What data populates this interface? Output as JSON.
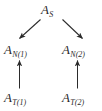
{
  "diagram": {
    "type": "commutative-diagram",
    "background_color": "#ffffff",
    "ink_color": "#2b2b2b",
    "nodes": [
      {
        "id": "A_S",
        "base": "A",
        "subscript": "S",
        "row": "top",
        "column": "center"
      },
      {
        "id": "A_N1",
        "base": "A",
        "subscript": "N(1)",
        "row": "middle",
        "column": "left"
      },
      {
        "id": "A_N2",
        "base": "A",
        "subscript": "N(2)",
        "row": "middle",
        "column": "right"
      },
      {
        "id": "A_T1",
        "base": "A",
        "subscript": "T(1)",
        "row": "bottom",
        "column": "left"
      },
      {
        "id": "A_T2",
        "base": "A",
        "subscript": "T(2)",
        "row": "bottom",
        "column": "right"
      }
    ],
    "edges": [
      {
        "id": "edge-as-to-an1",
        "from": "A_S",
        "to": "A_N1",
        "style": "solid",
        "direction": "down-left",
        "arrowhead": "target"
      },
      {
        "id": "edge-as-to-an2",
        "from": "A_S",
        "to": "A_N2",
        "style": "solid",
        "direction": "down-right",
        "arrowhead": "target"
      },
      {
        "id": "edge-at1-to-an1",
        "from": "A_T1",
        "to": "A_N1",
        "style": "solid",
        "direction": "up",
        "arrowhead": "target"
      },
      {
        "id": "edge-at2-to-an2",
        "from": "A_T2",
        "to": "A_N2",
        "style": "solid",
        "direction": "up",
        "arrowhead": "target"
      }
    ]
  }
}
